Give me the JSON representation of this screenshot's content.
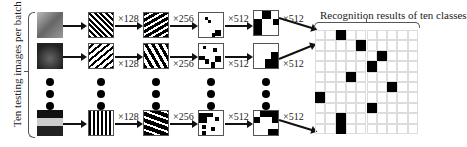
{
  "side_label": "Ten testing images per batch",
  "result_title": "Recognition results of ten classes",
  "multipliers": [
    "×128",
    "×256",
    "×512",
    "×512"
  ],
  "rows": [
    {
      "name": "row-1",
      "image_color": "#8a8a8a",
      "image_desc": "deer"
    },
    {
      "name": "row-2",
      "image_color": "#3a3a3a",
      "image_desc": "horse-dark"
    },
    {
      "name": "row-3",
      "image_color": "#1a1a1a",
      "image_desc": "airplane"
    }
  ],
  "colors": {
    "ink": "#111111",
    "grid_line": "#dddddd",
    "cell_on": "#000000"
  },
  "result_grid": {
    "rows": 10,
    "cols": 10,
    "active": [
      [
        0,
        2
      ],
      [
        1,
        4
      ],
      [
        2,
        6
      ],
      [
        3,
        5
      ],
      [
        4,
        3
      ],
      [
        5,
        7
      ],
      [
        6,
        0
      ],
      [
        7,
        5
      ],
      [
        8,
        2
      ],
      [
        9,
        2
      ]
    ]
  }
}
